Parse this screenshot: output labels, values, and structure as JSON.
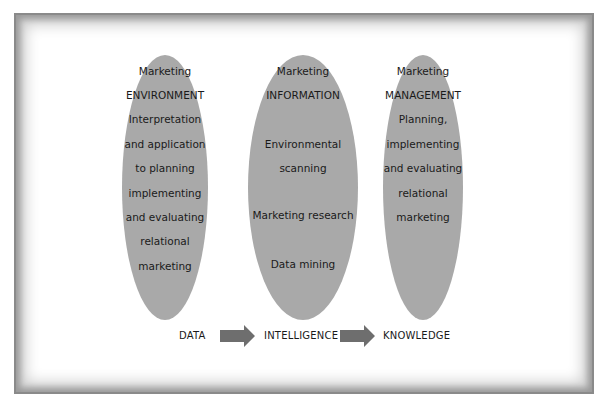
{
  "diagram": {
    "columns": [
      {
        "lines": [
          "Marketing",
          "ENVIRONMENT",
          "Interpretation",
          "and application",
          "to planning",
          "implementing",
          "and evaluating",
          "relational",
          "marketing"
        ]
      },
      {
        "lines": [
          "Marketing",
          "INFORMATION",
          "Environmental",
          "scanning",
          "Marketing research",
          "Data mining"
        ]
      },
      {
        "lines": [
          "Marketing",
          "MANAGEMENT",
          "Planning,",
          "implementing",
          "and evaluating",
          "relational",
          "marketing"
        ]
      }
    ],
    "flow": {
      "stages": [
        "DATA",
        "INTELLIGENCE",
        "KNOWLEDGE"
      ],
      "arrow_icon": "right-arrow-icon"
    },
    "colors": {
      "ellipse_fill": "#a9a9a9",
      "arrow_fill": "#6e6e6e",
      "frame_shade": "#8a8a8a",
      "text": "#1a1a1a"
    }
  }
}
